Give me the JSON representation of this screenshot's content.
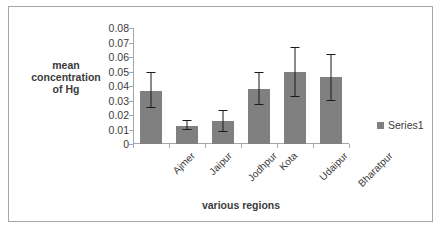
{
  "chart_data": {
    "type": "bar",
    "title": "",
    "xlabel": "various regions",
    "ylabel": "mean concentration of Hg",
    "ylabel_lines": [
      "mean",
      "concentration",
      "of Hg"
    ],
    "categories": [
      "Ajmer",
      "Jaipur",
      "Jodhpur",
      "Kota",
      "Udaipur",
      "Bharatpur"
    ],
    "values": [
      0.0365,
      0.0125,
      0.016,
      0.038,
      0.0495,
      0.046
    ],
    "error_low": [
      0.0245,
      0.0095,
      0.0085,
      0.027,
      0.0325,
      0.0295
    ],
    "error_high": [
      0.0495,
      0.0165,
      0.0235,
      0.05,
      0.067,
      0.062
    ],
    "series": [
      {
        "name": "Series1",
        "values": [
          0.0365,
          0.0125,
          0.016,
          0.038,
          0.0495,
          0.046
        ]
      }
    ],
    "ylim": [
      0,
      0.08
    ],
    "ytick_labels": [
      "0.08",
      "0.07",
      "0.06",
      "0.05",
      "0.04",
      "0.03",
      "0.02",
      "0.01",
      "0"
    ],
    "ytick_values": [
      0.08,
      0.07,
      0.06,
      0.05,
      0.04,
      0.03,
      0.02,
      0.01,
      0
    ],
    "grid": false,
    "legend_position": "right",
    "legend": [
      "Series1"
    ],
    "bar_color": "#808080",
    "error_bar_color": "#1a1a1a",
    "axis_color": "#a6a6a6",
    "text_color": "#3b3b3b"
  },
  "legend": {
    "series1_label": "Series1",
    "swatch_name": "legend-swatch"
  },
  "axes": {
    "x_title": "various regions",
    "y_title_line1": "mean",
    "y_title_line2": "concentration",
    "y_title_line3": "of Hg"
  },
  "yticks": {
    "t0": "0.08",
    "t1": "0.07",
    "t2": "0.06",
    "t3": "0.05",
    "t4": "0.04",
    "t5": "0.03",
    "t6": "0.02",
    "t7": "0.01",
    "t8": "0"
  },
  "xticks": {
    "c0": "Ajmer",
    "c1": "Jaipur",
    "c2": "Jodhpur",
    "c3": "Kota",
    "c4": "Udaipur",
    "c5": "Bharatpur"
  }
}
